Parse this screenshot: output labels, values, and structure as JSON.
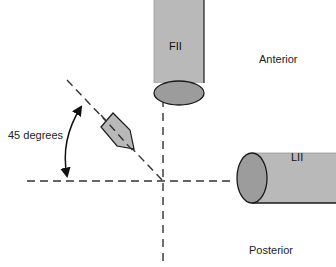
{
  "diagram": {
    "title": "",
    "labels": {
      "top_tube": "FII",
      "side_tube": "LII",
      "anterior": "Anterior",
      "posterior": "Posterior",
      "angle": "45 degrees"
    },
    "colors": {
      "tube_body": "#b9b9b9",
      "tube_face": "#9c9c9c",
      "stroke": "#1a1a1a",
      "dash": "#333333",
      "background": "#ffffff"
    },
    "geometry": {
      "center": [
        163,
        181
      ],
      "angle_degrees": 45
    }
  }
}
